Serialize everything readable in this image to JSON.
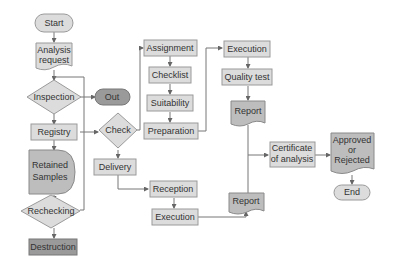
{
  "diagram": {
    "type": "flowchart",
    "nodes": {
      "start": "Start",
      "analysis_request_1": "Analysis",
      "analysis_request_2": "request",
      "inspection": "Inspection",
      "out": "Out",
      "registry": "Registry",
      "check": "Check",
      "retained_1": "Retained",
      "retained_2": "Samples",
      "rechecking": "Rechecking",
      "destruction": "Destruction",
      "delivery": "Delivery",
      "assignment": "Assignment",
      "checklist": "Checklist",
      "suitability": "Suitability",
      "preparation": "Preparation",
      "execution_top": "Execution",
      "quality_test": "Quality test",
      "report_top": "Report",
      "reception": "Reception",
      "execution_bottom": "Execution",
      "report_bottom": "Report",
      "certificate_1": "Certificate",
      "certificate_2": "of analysis",
      "approved_1": "Approved",
      "approved_2": "or",
      "approved_3": "Rejected",
      "end": "End"
    },
    "edges": [
      [
        "Start",
        "Analysis request"
      ],
      [
        "Analysis request",
        "Inspection"
      ],
      [
        "Inspection",
        "Out"
      ],
      [
        "Inspection",
        "Registry"
      ],
      [
        "Registry",
        "Check"
      ],
      [
        "Registry",
        "Retained Samples"
      ],
      [
        "Retained Samples",
        "Rechecking"
      ],
      [
        "Rechecking",
        "Destruction"
      ],
      [
        "Rechecking",
        "Inspection"
      ],
      [
        "Check",
        "Assignment"
      ],
      [
        "Check",
        "Delivery"
      ],
      [
        "Assignment",
        "Checklist"
      ],
      [
        "Checklist",
        "Suitability"
      ],
      [
        "Suitability",
        "Preparation"
      ],
      [
        "Preparation",
        "Execution"
      ],
      [
        "Execution",
        "Quality test"
      ],
      [
        "Quality test",
        "Report"
      ],
      [
        "Delivery",
        "Reception"
      ],
      [
        "Reception",
        "Execution"
      ],
      [
        "Execution",
        "Report"
      ],
      [
        "Report",
        "Certificate of analysis"
      ],
      [
        "Certificate of analysis",
        "Approved or Rejected"
      ],
      [
        "Approved or Rejected",
        "End"
      ]
    ]
  },
  "colors": {
    "light_fill": "#dcdcdc",
    "mid_fill": "#bdbdbd",
    "dark_fill": "#9a9a9a",
    "stroke": "#9a9a9a",
    "text": "#333333"
  }
}
